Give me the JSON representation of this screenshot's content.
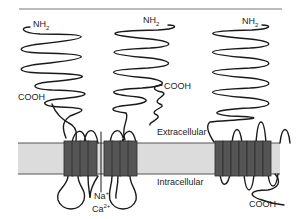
{
  "diagram": {
    "type": "membrane protein topology",
    "colors": {
      "membrane_fill": "#dcdcdc",
      "membrane_edge": "#555555",
      "helix_fill": "#555555",
      "chain_stroke": "#1a1a1a"
    },
    "labels": {
      "nh2_left": "NH",
      "nh2_left_sub": "2",
      "nh2_middle": "NH",
      "nh2_middle_sub": "2",
      "nh2_right": "NH",
      "nh2_right_sub": "2",
      "cooh_left": "COOH",
      "cooh_middle": "COOH",
      "cooh_right": "COOH",
      "extracellular": "Extracellular",
      "intracellular": "Intracellular",
      "ion_na": "Na",
      "ion_na_sup": "+",
      "ion_ca": "Ca",
      "ion_ca_sup": "2+"
    },
    "proteins": [
      {
        "name": "channel-domain-left",
        "helices": 4
      },
      {
        "name": "channel-domain-right",
        "helices": 4
      },
      {
        "name": "seven-transmembrane-receptor",
        "helices": 7
      }
    ]
  }
}
